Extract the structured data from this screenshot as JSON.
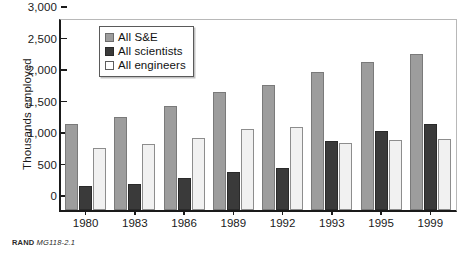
{
  "chart_data": {
    "type": "bar",
    "title": "",
    "xlabel": "",
    "ylabel": "Thousands employed",
    "categories": [
      "1980",
      "1983",
      "1986",
      "1989",
      "1992",
      "1993",
      "1995",
      "1999"
    ],
    "series": [
      {
        "name": "All S&E",
        "color": "#9d9d9d",
        "values": [
          1370,
          1470,
          1650,
          1880,
          1980,
          2190,
          2350,
          2480
        ]
      },
      {
        "name": "All scientists",
        "color": "#3a3a3a",
        "values": [
          380,
          420,
          510,
          600,
          670,
          1100,
          1250,
          1370
        ]
      },
      {
        "name": "All engineers",
        "color": "#f1f1f1",
        "values": [
          990,
          1040,
          1150,
          1290,
          1310,
          1070,
          1110,
          1120
        ]
      }
    ],
    "ylim": [
      0,
      3000
    ],
    "yticks": [
      0,
      500,
      1000,
      1500,
      2000,
      2500,
      3000
    ],
    "ytick_labels": [
      "0",
      "500",
      "1,000",
      "1,500",
      "2,000",
      "2,500",
      "3,000"
    ],
    "grid": false,
    "legend_position": "top-left-inside"
  },
  "legend": {
    "items": [
      {
        "label": "All S&E",
        "swatch": "se"
      },
      {
        "label": "All scientists",
        "swatch": "sci"
      },
      {
        "label": "All engineers",
        "swatch": "eng"
      }
    ]
  },
  "source": {
    "brand": "RAND",
    "doc": "MG118-2.1"
  }
}
